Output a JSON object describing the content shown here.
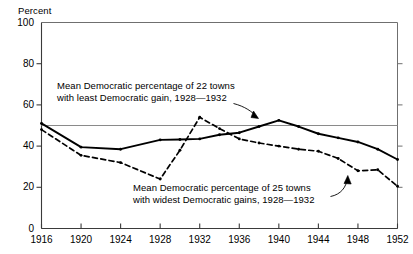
{
  "figure": {
    "y_axis_unit_label": "Percent",
    "annotations": {
      "upper": {
        "line1": "Mean Democratic percentage of 22 towns",
        "line2": "with least Democratic gain, 1928—1932"
      },
      "lower": {
        "line1": "Mean Democratic percentage of 25 towns",
        "line2": "with widest Democratic gains, 1928—1932"
      }
    },
    "colors": {
      "ink": "#000000",
      "reference_line": "#8a8a8a",
      "axis": "#6f6f6f",
      "background": "#ffffff"
    }
  },
  "chart_data": {
    "type": "line",
    "title": "",
    "xlabel": "",
    "ylabel": "Percent",
    "xlim": [
      1916,
      1952
    ],
    "ylim": [
      0,
      100
    ],
    "yticks": [
      0,
      20,
      40,
      60,
      80,
      100
    ],
    "xticks": [
      1916,
      1920,
      1924,
      1928,
      1932,
      1936,
      1940,
      1944,
      1948,
      1952
    ],
    "grid": false,
    "legend_position": "annotations",
    "reference_lines": [
      {
        "name": "fifty-percent-line",
        "y": 50,
        "orientation": "horizontal"
      }
    ],
    "series": [
      {
        "name": "Mean Democratic percentage of 22 towns with least Democratic gain, 1928—1932",
        "style": "solid",
        "marker": "dot",
        "x": [
          1916,
          1920,
          1924,
          1928,
          1930,
          1932,
          1934,
          1936,
          1938,
          1940,
          1942,
          1944,
          1946,
          1948,
          1950,
          1952
        ],
        "values": [
          51,
          39.5,
          38.5,
          43,
          43.2,
          43.5,
          45.5,
          46.5,
          49.5,
          52.5,
          49.5,
          46,
          44,
          42,
          38.5,
          33.5
        ]
      },
      {
        "name": "Mean Democratic percentage of 25 towns with widest Democratic gains, 1928—1932",
        "style": "dashed",
        "marker": "dot",
        "x": [
          1916,
          1920,
          1924,
          1928,
          1930,
          1932,
          1934,
          1936,
          1938,
          1940,
          1942,
          1944,
          1946,
          1948,
          1950,
          1952
        ],
        "values": [
          48,
          35.5,
          32,
          24,
          38,
          54,
          48.5,
          43.5,
          41.5,
          40,
          38.5,
          37.5,
          34,
          28,
          28.5,
          20.5
        ]
      }
    ]
  }
}
